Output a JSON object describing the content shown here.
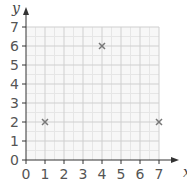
{
  "chart_data": {
    "type": "scatter",
    "title": "",
    "xlabel": "x",
    "ylabel": "y",
    "xlim": [
      0,
      7
    ],
    "ylim": [
      0,
      7
    ],
    "xticks": [
      0,
      1,
      2,
      3,
      4,
      5,
      6,
      7
    ],
    "yticks": [
      0,
      1,
      2,
      3,
      4,
      5,
      6,
      7
    ],
    "grid": true,
    "marker": "x",
    "series": [
      {
        "name": "points",
        "points": [
          {
            "x": 1,
            "y": 2
          },
          {
            "x": 4,
            "y": 6
          },
          {
            "x": 7,
            "y": 2
          }
        ]
      }
    ],
    "colors": {
      "grid_major": "#cfcfcf",
      "grid_minor": "#e6e6e6",
      "plot_background": "#f7f7f7",
      "axis": "#333333",
      "marker": "#777777",
      "tick_label": "#555555"
    }
  }
}
